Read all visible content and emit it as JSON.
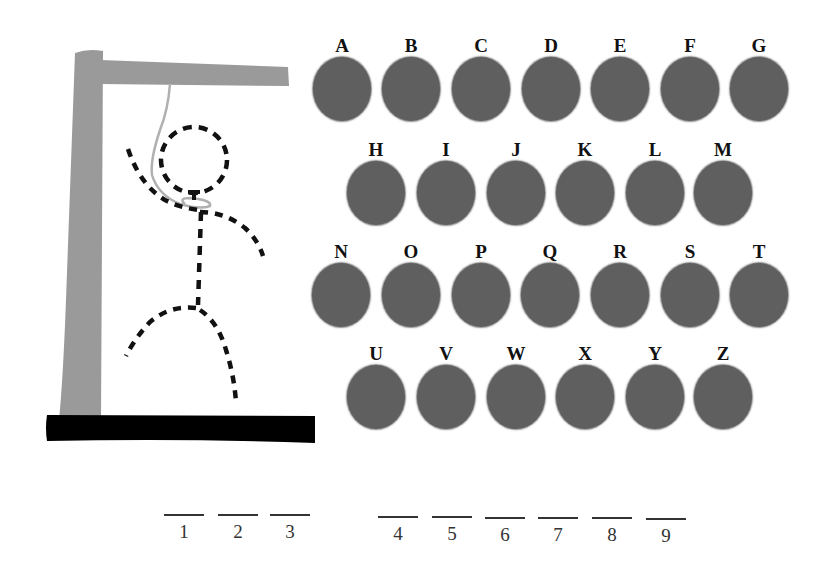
{
  "game": "hangman",
  "colors": {
    "background": "#ffffff",
    "gallows_post": "#9a9a9a",
    "gallows_base": "#000000",
    "rope": "#b0b0b0",
    "figure_dashes": "#111111",
    "letter_disc": "#5f5f5f",
    "letter_label": "#111111"
  },
  "keyboard": {
    "rows": [
      {
        "y": 36,
        "letters": [
          {
            "label": "A",
            "x": 312
          },
          {
            "label": "B",
            "x": 381
          },
          {
            "label": "C",
            "x": 451
          },
          {
            "label": "D",
            "x": 521
          },
          {
            "label": "E",
            "x": 590
          },
          {
            "label": "F",
            "x": 660
          },
          {
            "label": "G",
            "x": 729
          }
        ]
      },
      {
        "y": 140,
        "letters": [
          {
            "label": "H",
            "x": 346
          },
          {
            "label": "I",
            "x": 416
          },
          {
            "label": "J",
            "x": 486
          },
          {
            "label": "K",
            "x": 555
          },
          {
            "label": "L",
            "x": 625
          },
          {
            "label": "M",
            "x": 693
          }
        ]
      },
      {
        "y": 242,
        "letters": [
          {
            "label": "N",
            "x": 311
          },
          {
            "label": "O",
            "x": 381
          },
          {
            "label": "P",
            "x": 451
          },
          {
            "label": "Q",
            "x": 520
          },
          {
            "label": "R",
            "x": 590
          },
          {
            "label": "S",
            "x": 660
          },
          {
            "label": "T",
            "x": 729
          }
        ]
      },
      {
        "y": 344,
        "letters": [
          {
            "label": "U",
            "x": 346
          },
          {
            "label": "V",
            "x": 416
          },
          {
            "label": "W",
            "x": 486
          },
          {
            "label": "X",
            "x": 555
          },
          {
            "label": "Y",
            "x": 625
          },
          {
            "label": "Z",
            "x": 693
          }
        ]
      }
    ]
  },
  "word": {
    "words": [
      {
        "slots": [
          {
            "number": "1",
            "letter": "",
            "x": 164,
            "y": 514
          },
          {
            "number": "2",
            "letter": "",
            "x": 218,
            "y": 514
          },
          {
            "number": "3",
            "letter": "",
            "x": 270,
            "y": 514
          }
        ]
      },
      {
        "slots": [
          {
            "number": "4",
            "letter": "",
            "x": 378,
            "y": 516
          },
          {
            "number": "5",
            "letter": "",
            "x": 432,
            "y": 516
          },
          {
            "number": "6",
            "letter": "",
            "x": 485,
            "y": 517
          },
          {
            "number": "7",
            "letter": "",
            "x": 538,
            "y": 517
          },
          {
            "number": "8",
            "letter": "",
            "x": 592,
            "y": 517
          },
          {
            "number": "9",
            "letter": "",
            "x": 646,
            "y": 518
          }
        ]
      }
    ]
  }
}
